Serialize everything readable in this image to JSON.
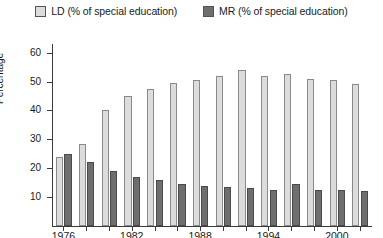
{
  "legend": {
    "items": [
      {
        "key": "ld",
        "label": "LD (% of special education)",
        "color": "#dcdcdc",
        "icon": "legend-swatch-icon"
      },
      {
        "key": "mr",
        "label": "MR (% of special education)",
        "color": "#6e6e6e",
        "icon": "legend-swatch-icon"
      }
    ]
  },
  "axis": {
    "y_title": "Percentage",
    "y_ticks": [
      "10",
      "20",
      "30",
      "40",
      "50",
      "60"
    ],
    "x_ticks": [
      "1976",
      "1982",
      "1988",
      "1994",
      "2000"
    ]
  },
  "chart_data": {
    "type": "bar",
    "title": "",
    "xlabel": "",
    "ylabel": "Percentage",
    "ylim": [
      0,
      63
    ],
    "yticks": [
      10,
      20,
      30,
      40,
      50,
      60
    ],
    "grid": false,
    "legend_position": "top-center",
    "categories": [
      "1976",
      "1978",
      "1980",
      "1982",
      "1984",
      "1986",
      "1988",
      "1990",
      "1992",
      "1994",
      "1996",
      "1998",
      "2000",
      "2002"
    ],
    "xtick_labels": [
      "1976",
      "1982",
      "1988",
      "1994",
      "2000"
    ],
    "series": [
      {
        "name": "LD (% of special education)",
        "color": "#dcdcdc",
        "values": [
          24.0,
          28.5,
          40.0,
          45.0,
          47.5,
          49.5,
          50.5,
          52.0,
          54.0,
          52.0,
          52.5,
          51.0,
          50.5,
          49.0
        ]
      },
      {
        "name": "MR (% of special education)",
        "color": "#6e6e6e",
        "values": [
          24.8,
          22.0,
          19.0,
          17.0,
          16.0,
          14.5,
          14.0,
          13.5,
          13.0,
          12.5,
          14.5,
          12.5,
          12.5,
          12.0
        ]
      }
    ]
  }
}
